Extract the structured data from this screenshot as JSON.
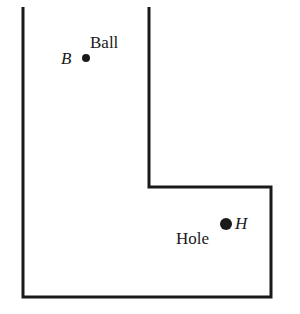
{
  "diagram": {
    "type": "golf-course-outline",
    "shape": "L-shaped region",
    "stroke_color": "#1a1a1a",
    "outline_points": [
      [
        23,
        7
      ],
      [
        23,
        297
      ],
      [
        271,
        297
      ],
      [
        271,
        187
      ],
      [
        149,
        187
      ],
      [
        149,
        7
      ]
    ],
    "ball": {
      "letter": "B",
      "label": "Ball",
      "x": 86,
      "y": 58
    },
    "hole": {
      "letter": "H",
      "label": "Hole",
      "x": 226,
      "y": 224
    }
  }
}
